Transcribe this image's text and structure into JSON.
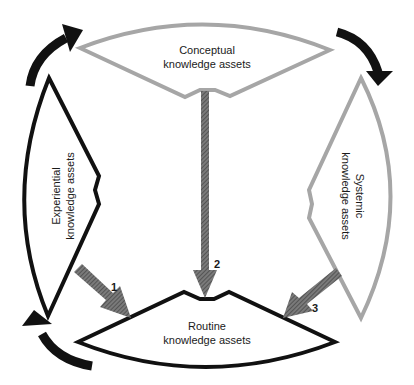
{
  "diagram": {
    "nodes": {
      "conceptual": {
        "line1": "Conceptual",
        "line2": "knowledge assets",
        "stroke": "#a6a6a6"
      },
      "experiential": {
        "line1": "Experiential",
        "line2": "knowledge assets",
        "stroke": "#111111"
      },
      "systemic": {
        "line1": "Systemic",
        "line2": "knowledge assets",
        "stroke": "#a6a6a6"
      },
      "routine": {
        "line1": "Routine",
        "line2": "knowledge assets",
        "stroke": "#111111"
      }
    },
    "flows": [
      {
        "label": "1",
        "from": "Experiential knowledge assets",
        "to": "Routine knowledge assets"
      },
      {
        "label": "2",
        "from": "Conceptual knowledge assets",
        "to": "Routine knowledge assets"
      },
      {
        "label": "3",
        "from": "Systemic knowledge assets",
        "to": "Routine knowledge assets"
      }
    ],
    "cycle_arrows": [
      "top-left",
      "top-right",
      "bottom-left"
    ],
    "colors": {
      "flow_arrow": "#6e6e6e",
      "cycle_arrow": "#111111"
    }
  }
}
